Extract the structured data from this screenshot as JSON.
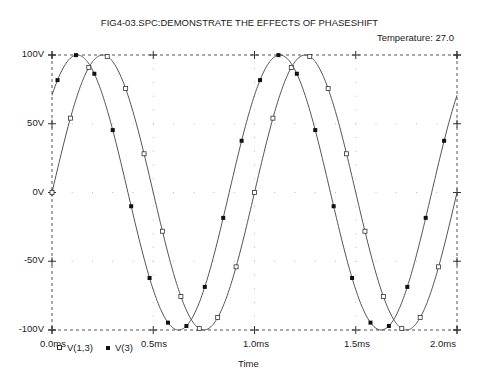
{
  "chart_data": {
    "type": "line",
    "title": "FIG4-03.SPC:DEMONSTRATE THE EFFECTS OF PHASESHIFT",
    "subtitle": "Temperature:  27.0",
    "xlabel": "Time",
    "ylabel": "",
    "xlim": [
      0.0,
      2.0
    ],
    "ylim": [
      -100,
      100
    ],
    "x_unit": "ms",
    "y_unit": "V",
    "x_ticks": [
      "0.0ms",
      "0.5ms",
      "1.0ms",
      "1.5ms",
      "2.0ms"
    ],
    "y_ticks": [
      "100V",
      "50V",
      "0V",
      "-50V",
      "-100V"
    ],
    "grid": true,
    "legend_position": "bottom-left",
    "series": [
      {
        "name": "V(1,3)",
        "marker": "open-square",
        "frequency_khz": 1.0,
        "amplitude_v": 100,
        "phase_deg": 0,
        "x": [
          0.0,
          0.125,
          0.25,
          0.375,
          0.5,
          0.625,
          0.75,
          0.875,
          1.0,
          1.125,
          1.25,
          1.375,
          1.5,
          1.625,
          1.75,
          1.875,
          2.0
        ],
        "values": [
          0,
          70.7,
          100,
          70.7,
          0,
          -70.7,
          -100,
          -70.7,
          0,
          70.7,
          100,
          70.7,
          0,
          -70.7,
          -100,
          -70.7,
          0
        ]
      },
      {
        "name": "V(3)",
        "marker": "filled-dot",
        "frequency_khz": 1.0,
        "amplitude_v": 100,
        "phase_deg": 45,
        "x": [
          0.0,
          0.125,
          0.25,
          0.375,
          0.5,
          0.625,
          0.75,
          0.875,
          1.0,
          1.125,
          1.25,
          1.375,
          1.5,
          1.625,
          1.75,
          1.875,
          2.0
        ],
        "values": [
          70.7,
          100,
          70.7,
          0,
          -70.7,
          -100,
          -70.7,
          0,
          70.7,
          100,
          70.7,
          0,
          -70.7,
          -100,
          -70.7,
          0,
          70.7
        ]
      }
    ]
  },
  "colors": {
    "curve": "#555555",
    "frame": "#555555",
    "grid_dots": "#bbbbbb"
  },
  "legend": {
    "items": [
      {
        "label": "V(1,3)",
        "marker": "open-square"
      },
      {
        "label": "V(3)",
        "marker": "filled-dot"
      }
    ]
  }
}
